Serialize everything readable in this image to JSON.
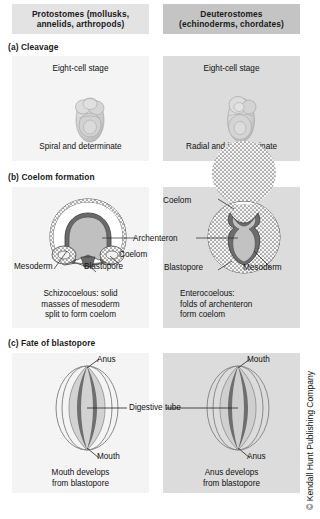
{
  "figure": {
    "columns": [
      {
        "title_line1": "Protostomes (mollusks,",
        "title_line2": "annelids, arthropods)",
        "bg": "#e3e3e3"
      },
      {
        "title_line1": "Deuterostomes",
        "title_line2": "(echinoderms, chordates)",
        "bg": "#c4c4c4"
      }
    ],
    "copyright": "© Kendall Hunt Publishing Company",
    "sections": [
      {
        "caption": "(a) Cleavage",
        "left": {
          "top_label": "Eight-cell stage",
          "bottom_text": "Spiral and determinate",
          "embryo": "spiral-eight-cell-embryo"
        },
        "right": {
          "top_label": "Eight-cell stage",
          "bottom_text": "Radial and indeterminate",
          "embryo": "radial-eight-cell-embryo"
        }
      },
      {
        "caption": "(b) Coelom formation",
        "left": {
          "labels": [
            "Mesoderm",
            "Blastopore",
            "Coelom"
          ],
          "shared_label": "Archenteron",
          "text_line1": "Schizocoelous: solid",
          "text_line2": "masses of mesoderm",
          "text_line3": "split to form coelom"
        },
        "right": {
          "labels": [
            "Coelom",
            "Blastopore",
            "Mesoderm"
          ],
          "shared_label": "Archenteron",
          "text_line1": "Enterocoelous:",
          "text_line2": "folds of archenteron",
          "text_line3": "form coelom"
        }
      },
      {
        "caption": "(c) Fate of blastopore",
        "shared_label": "Digestive tube",
        "left": {
          "top_label": "Anus",
          "bottom_label": "Mouth",
          "text_line1": "Mouth develops",
          "text_line2": "from blastopore"
        },
        "right": {
          "top_label": "Mouth",
          "bottom_label": "Anus",
          "text_line1": "Anus develops",
          "text_line2": "from blastopore"
        }
      }
    ]
  }
}
